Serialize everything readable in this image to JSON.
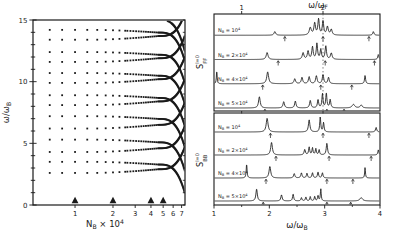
{
  "figure": {
    "ink": "#1a1a1a",
    "background": "#ffffff",
    "chart_data": [
      {
        "id": "left-panel",
        "type": "scatter",
        "title": "",
        "xlabel": {
          "pre": "N",
          "sub": "B",
          "mid": " × 10",
          "sup": "4",
          "name": "x-axis-label"
        },
        "ylabel": {
          "pre": "ω/ω",
          "sub": "B",
          "name": "y-axis-label"
        },
        "x_scale": "log",
        "xlim": [
          0.464,
          7.45
        ],
        "xticks": [
          1,
          2,
          3,
          4,
          5,
          6,
          7
        ],
        "ylim": [
          0,
          15
        ],
        "yticks": [
          0,
          5,
          10,
          15
        ],
        "y_minor_step": 1,
        "triangle_markers_x": [
          1,
          2,
          4,
          5
        ],
        "mode_pairs_omega": [
          [
            2.6,
            3.5
          ],
          [
            4.3,
            5.3
          ],
          [
            6.2,
            7.2
          ],
          [
            8.1,
            8.9
          ],
          [
            9.9,
            10.7
          ],
          [
            11.6,
            12.4
          ],
          [
            13.4,
            14.2
          ]
        ],
        "branch_params": {
          "lower": {
            "slow": 0.3,
            "steep": 1.85
          },
          "upper": {
            "slow": -0.22,
            "steep": -2.35
          },
          "extra": [
            {
              "base": 15.9,
              "slow": -0.9,
              "steep": -2.6
            }
          ],
          "bend": {
            "t1_start": 1.4,
            "t1_end": 4.6,
            "exp1": 1.6,
            "exp2": 3.2
          }
        }
      },
      {
        "id": "right-panels",
        "type": "line",
        "xlabel": {
          "pre": "ω/ω",
          "sub": "B",
          "name": "x-axis-label"
        },
        "top_axis_label": {
          "pre": "ω/ω",
          "sub": "F",
          "name": "top-axis-label"
        },
        "xlim": [
          1,
          4
        ],
        "xticks": [
          1,
          2,
          3,
          4
        ],
        "x_minor_ticks": [
          1.5,
          2.5,
          3.5
        ],
        "top_ticks": [
          {
            "label": "1",
            "pos": 1.5
          },
          {
            "label": "2",
            "pos": 2.97
          }
        ],
        "dashed_line_pos": 2.97,
        "panels": [
          {
            "ylabel": {
              "pre": "S",
              "sub": "FF",
              "sup": "l=0",
              "stacked": true,
              "name": "sff-axis-label"
            },
            "rows": [
              {
                "label": {
                  "pre": "N",
                  "sub": "B",
                  "mid": " = 10",
                  "sup": "4"
                },
                "peaks": [
                  [
                    2.1,
                    0.22,
                    0.018
                  ],
                  [
                    2.74,
                    0.45,
                    0.022
                  ],
                  [
                    2.82,
                    0.72,
                    0.017
                  ],
                  [
                    2.89,
                    0.95,
                    0.015
                  ],
                  [
                    2.97,
                    0.85,
                    0.015
                  ],
                  [
                    3.05,
                    0.5,
                    0.018
                  ],
                  [
                    3.12,
                    0.34,
                    0.018
                  ],
                  [
                    3.88,
                    0.22,
                    0.014
                  ]
                ],
                "arrows": [
                  2.28,
                  2.97,
                  3.8
                ]
              },
              {
                "label": {
                  "pre": "N",
                  "sub": "B",
                  "mid": " = 2×10",
                  "sup": "4"
                },
                "peaks": [
                  [
                    1.96,
                    0.42,
                    0.02
                  ],
                  [
                    2.61,
                    0.4,
                    0.018
                  ],
                  [
                    2.7,
                    0.5,
                    0.016
                  ],
                  [
                    2.78,
                    0.75,
                    0.015
                  ],
                  [
                    2.86,
                    0.95,
                    0.014
                  ],
                  [
                    2.93,
                    0.6,
                    0.014
                  ],
                  [
                    3.02,
                    0.8,
                    0.015
                  ],
                  [
                    3.12,
                    0.38,
                    0.018
                  ],
                  [
                    3.97,
                    0.3,
                    0.012
                  ]
                ],
                "arrows": [
                  2.16,
                  3.01,
                  3.9
                ]
              },
              {
                "label": {
                  "pre": "N",
                  "sub": "B",
                  "mid": " = 4×10",
                  "sup": "4"
                },
                "peaks": [
                  [
                    1.05,
                    0.8,
                    0.008
                  ],
                  [
                    1.97,
                    0.72,
                    0.02
                  ],
                  [
                    2.46,
                    0.3,
                    0.017
                  ],
                  [
                    2.59,
                    0.38,
                    0.016
                  ],
                  [
                    2.72,
                    0.42,
                    0.016
                  ],
                  [
                    2.85,
                    0.48,
                    0.016
                  ],
                  [
                    2.97,
                    0.55,
                    0.015
                  ],
                  [
                    3.07,
                    0.38,
                    0.015
                  ],
                  [
                    3.73,
                    0.5,
                    0.011
                  ]
                ],
                "arrows": [
                  1.88,
                  2.93,
                  3.49
                ]
              },
              {
                "label": {
                  "pre": "N",
                  "sub": "B",
                  "mid": " = 5×10",
                  "sup": "4"
                },
                "peaks": [
                  [
                    1.82,
                    0.68,
                    0.018
                  ],
                  [
                    2.26,
                    0.38,
                    0.016
                  ],
                  [
                    2.47,
                    0.42,
                    0.015
                  ],
                  [
                    2.74,
                    0.45,
                    0.015
                  ],
                  [
                    2.88,
                    0.5,
                    0.013
                  ],
                  [
                    2.96,
                    0.85,
                    0.012
                  ],
                  [
                    3.03,
                    0.9,
                    0.012
                  ],
                  [
                    3.1,
                    0.5,
                    0.013
                  ],
                  [
                    3.52,
                    0.22,
                    0.028
                  ],
                  [
                    3.66,
                    0.18,
                    0.022
                  ]
                ],
                "arrows": [
                  1.92,
                  3.04,
                  3.35
                ]
              }
            ]
          },
          {
            "ylabel": {
              "pre": "S",
              "sub": "BB",
              "sup": "l=0",
              "stacked": true,
              "name": "sbb-axis-label"
            },
            "rows": [
              {
                "label": {
                  "pre": "N",
                  "sub": "B",
                  "mid": " = 10",
                  "sup": "4"
                },
                "peaks": [
                  [
                    1.96,
                    0.88,
                    0.02
                  ],
                  [
                    2.72,
                    0.78,
                    0.016
                  ],
                  [
                    2.92,
                    0.95,
                    0.011
                  ],
                  [
                    2.98,
                    0.6,
                    0.011
                  ],
                  [
                    3.93,
                    0.3,
                    0.013
                  ]
                ],
                "arrows": [
                  2.02,
                  2.97,
                  3.8
                ]
              },
              {
                "label": {
                  "pre": "N",
                  "sub": "B",
                  "mid": " = 2×10",
                  "sup": "4"
                },
                "peaks": [
                  [
                    2.04,
                    0.82,
                    0.018
                  ],
                  [
                    2.64,
                    0.35,
                    0.014
                  ],
                  [
                    2.72,
                    0.5,
                    0.012
                  ],
                  [
                    2.78,
                    0.45,
                    0.011
                  ],
                  [
                    2.84,
                    0.4,
                    0.011
                  ],
                  [
                    2.9,
                    0.33,
                    0.011
                  ],
                  [
                    3.04,
                    0.75,
                    0.014
                  ],
                  [
                    3.97,
                    0.33,
                    0.011
                  ]
                ],
                "arrows": [
                  2.12,
                  3.08,
                  3.84
                ]
              },
              {
                "label": {
                  "pre": "N",
                  "sub": "B",
                  "mid": " = 4×10",
                  "sup": "4"
                },
                "peaks": [
                  [
                    1.59,
                    0.92,
                    0.009
                  ],
                  [
                    2.01,
                    0.75,
                    0.018
                  ],
                  [
                    2.45,
                    0.28,
                    0.014
                  ],
                  [
                    2.58,
                    0.33,
                    0.013
                  ],
                  [
                    2.68,
                    0.3,
                    0.012
                  ],
                  [
                    2.78,
                    0.33,
                    0.012
                  ],
                  [
                    2.88,
                    0.38,
                    0.012
                  ],
                  [
                    2.96,
                    0.33,
                    0.012
                  ],
                  [
                    3.73,
                    0.68,
                    0.008
                  ]
                ],
                "arrows": [
                  1.94,
                  3.04,
                  3.51
                ]
              },
              {
                "label": {
                  "pre": "N",
                  "sub": "B",
                  "mid": " = 5×10",
                  "sup": "4"
                },
                "peaks": [
                  [
                    1.77,
                    0.78,
                    0.015
                  ],
                  [
                    2.22,
                    0.4,
                    0.014
                  ],
                  [
                    2.43,
                    0.45,
                    0.012
                  ],
                  [
                    2.58,
                    0.22,
                    0.011
                  ],
                  [
                    2.66,
                    0.25,
                    0.011
                  ],
                  [
                    2.74,
                    0.28,
                    0.01
                  ],
                  [
                    2.82,
                    0.3,
                    0.01
                  ],
                  [
                    2.88,
                    0.35,
                    0.01
                  ],
                  [
                    2.93,
                    0.78,
                    0.009
                  ],
                  [
                    3.66,
                    0.22,
                    0.028
                  ]
                ],
                "arrows": [
                  1.89,
                  3.04,
                  3.47
                ]
              }
            ]
          }
        ]
      }
    ]
  }
}
